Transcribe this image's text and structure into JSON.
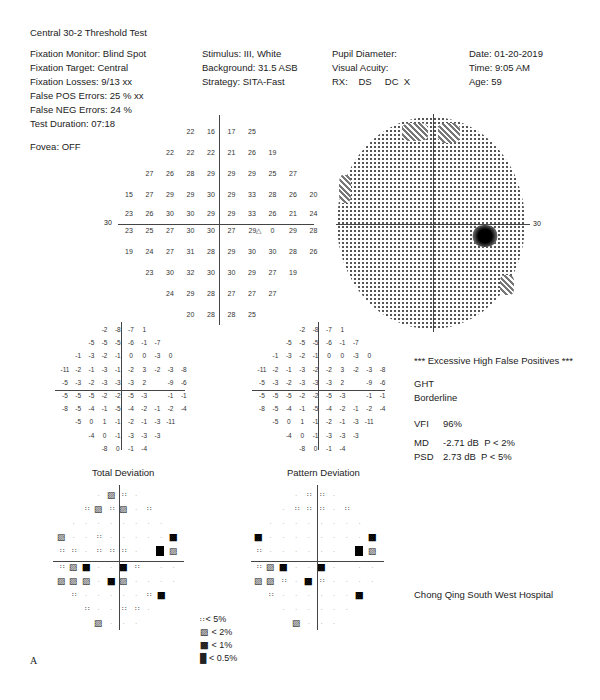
{
  "title": "Central 30-2 Threshold Test",
  "patient_info": {
    "col1": [
      "Fixation Monitor: Blind Spot",
      "Fixation Target: Central",
      "Fixation Losses: 9/13 xx",
      "False POS Errors:  25 % xx",
      "False NEG Errors:  24 %",
      "Test Duration: 07:18"
    ],
    "fovea": "Fovea: OFF",
    "col2": [
      "Stimulus: III, White",
      "Background: 31.5 ASB",
      "Strategy: SITA-Fast"
    ],
    "col3": [
      "Pupil Diameter:",
      "Visual Acuity:",
      "RX:    DS     DC  X"
    ],
    "col4": [
      "Date: 01-20-2019",
      "Time:  9:05 AM",
      "Age: 59"
    ]
  },
  "threshold": {
    "axis_label_left": "30",
    "axis_label_right": "30",
    "rows": [
      [
        null,
        null,
        null,
        "22",
        "16",
        "17",
        "25",
        null,
        null,
        null
      ],
      [
        null,
        null,
        "22",
        "22",
        "22",
        "21",
        "26",
        "19",
        null,
        null
      ],
      [
        null,
        "27",
        "26",
        "28",
        "29",
        "29",
        "29",
        "25",
        "27",
        null
      ],
      [
        "15",
        "27",
        "29",
        "29",
        "30",
        "29",
        "33",
        "28",
        "26",
        "20"
      ],
      [
        "23",
        "26",
        "30",
        "30",
        "29",
        "29",
        "33",
        "26",
        "21",
        "24"
      ],
      [
        "23",
        "25",
        "27",
        "30",
        "30",
        "27",
        "29",
        "0",
        "29",
        "28"
      ],
      [
        "19",
        "24",
        "27",
        "31",
        "28",
        "29",
        "30",
        "30",
        "28",
        "26"
      ],
      [
        null,
        "23",
        "30",
        "32",
        "30",
        "30",
        "29",
        "27",
        "19",
        null
      ],
      [
        null,
        null,
        "24",
        "29",
        "28",
        "27",
        "27",
        "27",
        null,
        null
      ],
      [
        null,
        null,
        null,
        "20",
        "28",
        "28",
        "25",
        null,
        null,
        null
      ]
    ],
    "blind_spot_marker": "△"
  },
  "total_deviation": {
    "title": "Total Deviation",
    "rows": [
      [
        null,
        null,
        null,
        "-2",
        "-8",
        "-7",
        "1",
        null,
        null,
        null
      ],
      [
        null,
        null,
        "-5",
        "-5",
        "-5",
        "-6",
        "-1",
        "-7",
        null,
        null
      ],
      [
        null,
        "-1",
        "-3",
        "-2",
        "-1",
        "0",
        "0",
        "-3",
        "0",
        null
      ],
      [
        "-11",
        "-2",
        "-1",
        "-3",
        "-1",
        "-2",
        "3",
        "-2",
        "-3",
        "-8"
      ],
      [
        "-5",
        "-3",
        "-2",
        "-3",
        "-3",
        "-3",
        "2",
        null,
        "-9",
        "-6"
      ],
      [
        "-5",
        "-5",
        "-5",
        "-2",
        "-2",
        "-5",
        "-3",
        null,
        "-1",
        "-1"
      ],
      [
        "-8",
        "-5",
        "-4",
        "-1",
        "-5",
        "-4",
        "-2",
        "-1",
        "-2",
        "-4"
      ],
      [
        null,
        "-5",
        "0",
        "1",
        "-1",
        "-2",
        "-1",
        "-3",
        "-11",
        null
      ],
      [
        null,
        null,
        "-4",
        "0",
        "-1",
        "-3",
        "-3",
        "-3",
        null,
        null
      ],
      [
        null,
        null,
        null,
        "-8",
        "0",
        "-1",
        "-4",
        null,
        null,
        null
      ]
    ],
    "prob_rows": [
      [
        null,
        null,
        null,
        "n",
        "2",
        "5",
        "n",
        null,
        null,
        null
      ],
      [
        null,
        null,
        "5",
        "2",
        "5",
        "2",
        "n",
        "5",
        null,
        null
      ],
      [
        null,
        "n",
        "n",
        "n",
        "n",
        "n",
        "n",
        "n",
        "n",
        null
      ],
      [
        "2",
        "n",
        "n",
        "5",
        "n",
        "n",
        "n",
        "n",
        "n",
        "1"
      ],
      [
        "5",
        "5",
        "n",
        "5",
        "5",
        "5",
        "n",
        null,
        "0.5",
        "2"
      ],
      [
        "5",
        "2",
        "1",
        "n",
        "n",
        "1",
        "5",
        null,
        "n",
        "n"
      ],
      [
        "2",
        "2",
        "2",
        "n",
        "1",
        "2",
        "n",
        "n",
        "n",
        "n"
      ],
      [
        null,
        "5",
        "n",
        "n",
        "n",
        "n",
        "n",
        "5",
        "1",
        null
      ],
      [
        null,
        null,
        "5",
        "n",
        "n",
        "5",
        "5",
        "n",
        null,
        null
      ],
      [
        null,
        null,
        null,
        "2",
        "n",
        "n",
        "n",
        null,
        null,
        null
      ]
    ]
  },
  "pattern_deviation": {
    "title": "Pattern Deviation",
    "rows": [
      [
        null,
        null,
        null,
        "-2",
        "-8",
        "-7",
        "1",
        null,
        null,
        null
      ],
      [
        null,
        null,
        "-5",
        "-5",
        "-5",
        "-6",
        "-1",
        "-7",
        null,
        null
      ],
      [
        null,
        "-1",
        "-3",
        "-2",
        "-1",
        "0",
        "0",
        "-3",
        "0",
        null
      ],
      [
        "-11",
        "-2",
        "-1",
        "-3",
        "-2",
        "-2",
        "3",
        "-2",
        "-3",
        "-8"
      ],
      [
        "-5",
        "-3",
        "-2",
        "-3",
        "-3",
        "-3",
        "2",
        null,
        "-9",
        "-6"
      ],
      [
        "-5",
        "-5",
        "-5",
        "-2",
        "-2",
        "-5",
        "-3",
        null,
        "-1",
        "-1"
      ],
      [
        "-8",
        "-5",
        "-4",
        "-1",
        "-5",
        "-4",
        "-2",
        "-1",
        "-2",
        "-4"
      ],
      [
        null,
        "-5",
        "0",
        "1",
        "-1",
        "-2",
        "-1",
        "-3",
        "-11",
        null
      ],
      [
        null,
        null,
        "-4",
        "0",
        "-1",
        "-3",
        "-3",
        "-3",
        null,
        null
      ],
      [
        null,
        null,
        null,
        "-8",
        "0",
        "-1",
        "-4",
        null,
        null,
        null
      ]
    ],
    "prob_rows": [
      [
        null,
        null,
        null,
        "n",
        "5",
        "5",
        "n",
        null,
        null,
        null
      ],
      [
        null,
        null,
        "n",
        "5",
        "5",
        "5",
        "n",
        "5",
        null,
        null
      ],
      [
        null,
        "n",
        "n",
        "n",
        "n",
        "n",
        "n",
        "n",
        "n",
        null
      ],
      [
        "1",
        "n",
        "n",
        "n",
        "n",
        "n",
        "n",
        "n",
        "n",
        "1"
      ],
      [
        "5",
        "n",
        "n",
        "n",
        "n",
        "n",
        "n",
        null,
        "0.5",
        "2"
      ],
      [
        "5",
        "2",
        "1",
        "n",
        "n",
        "1",
        "n",
        null,
        "n",
        "n"
      ],
      [
        "2",
        "2",
        "5",
        "n",
        "1",
        "5",
        "n",
        "n",
        "n",
        "n"
      ],
      [
        null,
        "5",
        "n",
        "n",
        "n",
        "n",
        "n",
        "n",
        "1",
        null
      ],
      [
        null,
        null,
        "n",
        "n",
        "n",
        "n",
        "n",
        "n",
        null,
        null
      ],
      [
        null,
        null,
        null,
        "2",
        "n",
        "n",
        "n",
        null,
        null,
        null
      ]
    ]
  },
  "summary": {
    "warning": "*** Excessive High False Positives ***",
    "ght_label": "GHT",
    "ght_value": "Borderline",
    "vfi_label": "VFI",
    "vfi_value": "96%",
    "md_label": "MD",
    "md_value": "-2.71 dB  P < 2%",
    "psd_label": "PSD",
    "psd_value": "2.73 dB  P < 5%"
  },
  "legend": [
    {
      "symbol": "5",
      "label": "< 5%"
    },
    {
      "symbol": "2",
      "label": "< 2%"
    },
    {
      "symbol": "1",
      "label": "< 1%"
    },
    {
      "symbol": "0.5",
      "label": "< 0.5%"
    }
  ],
  "hospital": "Chong Qing South West Hospital",
  "figure_label": "A",
  "greyscale_axis_label": "30"
}
